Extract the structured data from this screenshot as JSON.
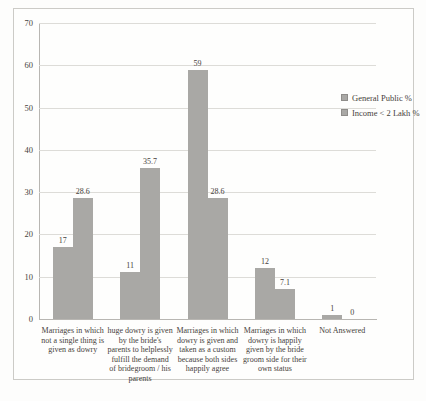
{
  "figure": {
    "colors": {
      "bar": "#a9a8a5",
      "grid": "#dddcd8",
      "axis": "#b8b6b2",
      "frame_border": "#cccbc7",
      "text": "#47423c",
      "background": "#fdfdfc"
    }
  },
  "chart_data": {
    "type": "bar",
    "title": "",
    "xlabel": "",
    "ylabel": "",
    "categories": [
      "Marriages in which not a single thing is given as dowry",
      "huge dowry is given by the bride's parents to helplessly fulfill the demand of bridegroom / his parents",
      "Marriages in which dowry is given and taken as a custom because both sides happily agree",
      "Marriages in which dowry is happily given by the bride groom side for their own status",
      "Not Answered"
    ],
    "series": [
      {
        "name": "General Public %",
        "color": "#a9a8a5",
        "values": [
          17,
          11,
          59,
          12,
          1
        ]
      },
      {
        "name": "Income < 2 Lakh %",
        "color": "#a9a8a5",
        "values": [
          28.6,
          35.7,
          28.6,
          7.1,
          0
        ]
      }
    ],
    "ylim": [
      0,
      70
    ],
    "yticks": [
      0,
      10,
      20,
      30,
      40,
      50,
      60,
      70
    ],
    "grid": true,
    "legend_position": "right",
    "value_labels": true
  }
}
